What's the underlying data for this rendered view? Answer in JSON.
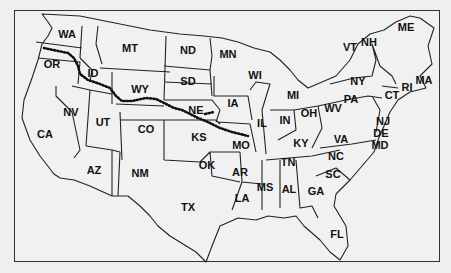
{
  "map": {
    "title": "United States outline map",
    "trail": "dotted route from Missouri to Oregon",
    "states": [
      {
        "abbr": "WA",
        "x": 67,
        "y": 34
      },
      {
        "abbr": "OR",
        "x": 52,
        "y": 64
      },
      {
        "abbr": "ID",
        "x": 93,
        "y": 73
      },
      {
        "abbr": "MT",
        "x": 130,
        "y": 48
      },
      {
        "abbr": "ND",
        "x": 188,
        "y": 50
      },
      {
        "abbr": "SD",
        "x": 188,
        "y": 81
      },
      {
        "abbr": "WY",
        "x": 140,
        "y": 89
      },
      {
        "abbr": "NE",
        "x": 196,
        "y": 110
      },
      {
        "abbr": "NV",
        "x": 71,
        "y": 112
      },
      {
        "abbr": "UT",
        "x": 103,
        "y": 122
      },
      {
        "abbr": "CO",
        "x": 146,
        "y": 129
      },
      {
        "abbr": "CA",
        "x": 45,
        "y": 134
      },
      {
        "abbr": "KS",
        "x": 199,
        "y": 137
      },
      {
        "abbr": "AZ",
        "x": 94,
        "y": 170
      },
      {
        "abbr": "NM",
        "x": 140,
        "y": 173
      },
      {
        "abbr": "OK",
        "x": 207,
        "y": 165
      },
      {
        "abbr": "TX",
        "x": 188,
        "y": 207
      },
      {
        "abbr": "MN",
        "x": 228,
        "y": 54
      },
      {
        "abbr": "IA",
        "x": 233,
        "y": 103
      },
      {
        "abbr": "MO",
        "x": 241,
        "y": 145
      },
      {
        "abbr": "AR",
        "x": 240,
        "y": 172
      },
      {
        "abbr": "LA",
        "x": 242,
        "y": 198
      },
      {
        "abbr": "WI",
        "x": 255,
        "y": 75
      },
      {
        "abbr": "IL",
        "x": 262,
        "y": 123
      },
      {
        "abbr": "MI",
        "x": 293,
        "y": 95
      },
      {
        "abbr": "IN",
        "x": 285,
        "y": 120
      },
      {
        "abbr": "OH",
        "x": 309,
        "y": 113
      },
      {
        "abbr": "KY",
        "x": 301,
        "y": 143
      },
      {
        "abbr": "TN",
        "x": 288,
        "y": 162
      },
      {
        "abbr": "MS",
        "x": 265,
        "y": 187
      },
      {
        "abbr": "AL",
        "x": 289,
        "y": 189
      },
      {
        "abbr": "GA",
        "x": 316,
        "y": 191
      },
      {
        "abbr": "FL",
        "x": 337,
        "y": 234
      },
      {
        "abbr": "SC",
        "x": 333,
        "y": 174
      },
      {
        "abbr": "NC",
        "x": 336,
        "y": 156
      },
      {
        "abbr": "VA",
        "x": 341,
        "y": 139
      },
      {
        "abbr": "WV",
        "x": 333,
        "y": 108
      },
      {
        "abbr": "PA",
        "x": 351,
        "y": 99
      },
      {
        "abbr": "NY",
        "x": 358,
        "y": 81
      },
      {
        "abbr": "VT",
        "x": 350,
        "y": 47
      },
      {
        "abbr": "NH",
        "x": 369,
        "y": 42
      },
      {
        "abbr": "ME",
        "x": 406,
        "y": 27
      },
      {
        "abbr": "MA",
        "x": 424,
        "y": 80
      },
      {
        "abbr": "RI",
        "x": 407,
        "y": 87
      },
      {
        "abbr": "CT",
        "x": 392,
        "y": 95
      },
      {
        "abbr": "NJ",
        "x": 383,
        "y": 121
      },
      {
        "abbr": "DE",
        "x": 381,
        "y": 133
      },
      {
        "abbr": "MD",
        "x": 380,
        "y": 145
      }
    ]
  }
}
